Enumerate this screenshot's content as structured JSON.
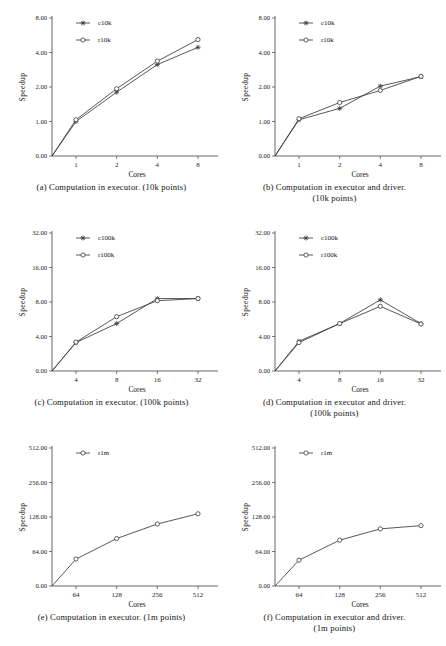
{
  "figure": {
    "ylabel": "Speedup",
    "xlabel": "Cores"
  },
  "chart_data": [
    {
      "id": "a",
      "type": "line",
      "title": "",
      "caption_lines": [
        "(a) Computation in executor. (10k points)"
      ],
      "xlabel": "Cores",
      "ylabel": "Speedup",
      "x": [
        1,
        2,
        4,
        8
      ],
      "xtick_labels": [
        "1",
        "2",
        "4",
        "8"
      ],
      "ytick_labels": [
        "0.00",
        "1.00",
        "2.00",
        "4.00",
        "8.00"
      ],
      "ytick_values": [
        0.0,
        1.0,
        2.0,
        4.0,
        8.0
      ],
      "yscale": "log2-with-zero",
      "ylim": [
        0.0,
        8.0
      ],
      "grid": false,
      "legend_position": "top-center",
      "series": [
        {
          "name": "c10k",
          "marker": "star",
          "values": [
            1.0,
            1.85,
            3.3,
            4.6
          ]
        },
        {
          "name": "r10k",
          "marker": "circle",
          "values": [
            1.05,
            1.95,
            3.5,
            5.5
          ]
        }
      ]
    },
    {
      "id": "b",
      "type": "line",
      "title": "",
      "caption_lines": [
        "(b) Computation in executor and driver.",
        "(10k points)"
      ],
      "xlabel": "Cores",
      "ylabel": "Speedup",
      "x": [
        1,
        2,
        4,
        8
      ],
      "xtick_labels": [
        "1",
        "2",
        "4",
        "8"
      ],
      "ytick_labels": [
        "0.00",
        "1.00",
        "2.00",
        "4.00",
        "8.00"
      ],
      "ytick_values": [
        0.0,
        1.0,
        2.0,
        4.0,
        8.0
      ],
      "yscale": "log2-with-zero",
      "ylim": [
        0.0,
        8.0
      ],
      "grid": false,
      "legend_position": "top-center",
      "series": [
        {
          "name": "c10k",
          "marker": "star",
          "values": [
            1.05,
            1.38,
            2.05,
            2.6
          ]
        },
        {
          "name": "r10k",
          "marker": "circle",
          "values": [
            1.08,
            1.55,
            1.9,
            2.62
          ]
        }
      ]
    },
    {
      "id": "c",
      "type": "line",
      "title": "",
      "caption_lines": [
        "(c) Computation in executor. (100k points)"
      ],
      "xlabel": "Cores",
      "ylabel": "Speedup",
      "x": [
        4,
        8,
        16,
        32
      ],
      "xtick_labels": [
        "4",
        "8",
        "16",
        "32"
      ],
      "ytick_labels": [
        "0.00",
        "4.00",
        "8.00",
        "16.00",
        "32.00"
      ],
      "ytick_values": [
        0.0,
        4.0,
        8.0,
        16.0,
        32.0
      ],
      "yscale": "log2-with-zero",
      "ylim": [
        0.0,
        32.0
      ],
      "grid": false,
      "legend_position": "top-center",
      "series": [
        {
          "name": "c100k",
          "marker": "star",
          "values": [
            3.3,
            5.5,
            8.8,
            8.8
          ]
        },
        {
          "name": "r100k",
          "marker": "circle",
          "values": [
            3.35,
            6.3,
            8.3,
            8.8
          ]
        }
      ]
    },
    {
      "id": "d",
      "type": "line",
      "title": "",
      "caption_lines": [
        "(d) Computation in executor and driver.",
        "(100k points)"
      ],
      "xlabel": "Cores",
      "ylabel": "Speedup",
      "x": [
        4,
        8,
        16,
        32
      ],
      "xtick_labels": [
        "4",
        "8",
        "16",
        "32"
      ],
      "ytick_labels": [
        "0.00",
        "4.00",
        "8.00",
        "16.00",
        "32.00"
      ],
      "ytick_values": [
        0.0,
        4.0,
        8.0,
        16.0,
        32.0
      ],
      "yscale": "log2-with-zero",
      "ylim": [
        0.0,
        32.0
      ],
      "grid": false,
      "legend_position": "top-center",
      "series": [
        {
          "name": "c100k",
          "marker": "star",
          "values": [
            3.45,
            5.5,
            8.5,
            5.5
          ]
        },
        {
          "name": "r100k",
          "marker": "circle",
          "values": [
            3.3,
            5.5,
            7.5,
            5.45
          ]
        }
      ]
    },
    {
      "id": "e",
      "type": "line",
      "title": "",
      "caption_lines": [
        "(e) Computation in executor. (1m points)"
      ],
      "xlabel": "Cores",
      "ylabel": "Speedup",
      "x": [
        64,
        128,
        256,
        512
      ],
      "xtick_labels": [
        "64",
        "128",
        "256",
        "512"
      ],
      "ytick_labels": [
        "0.00",
        "64.00",
        "128.00",
        "256.00",
        "512.00"
      ],
      "ytick_values": [
        0.0,
        64.0,
        128.0,
        256.0,
        512.0
      ],
      "yscale": "log2-with-zero",
      "ylim": [
        0.0,
        512.0
      ],
      "grid": false,
      "legend_position": "top-center",
      "series": [
        {
          "name": "r1m",
          "marker": "circle",
          "values": [
            50,
            88,
            115,
            140
          ]
        }
      ]
    },
    {
      "id": "f",
      "type": "line",
      "title": "",
      "caption_lines": [
        "(f) Computation in executor and driver.",
        "(1m points)"
      ],
      "xlabel": "Cores",
      "ylabel": "Speedup",
      "x": [
        64,
        128,
        256,
        512
      ],
      "xtick_labels": [
        "64",
        "128",
        "256",
        "512"
      ],
      "ytick_labels": [
        "0.00",
        "64.00",
        "128.00",
        "256.00",
        "512.00"
      ],
      "ytick_values": [
        0.0,
        64.0,
        128.0,
        256.0,
        512.0
      ],
      "yscale": "log2-with-zero",
      "ylim": [
        0.0,
        512.0
      ],
      "grid": false,
      "legend_position": "top-center",
      "series": [
        {
          "name": "r1m",
          "marker": "circle",
          "values": [
            48,
            85,
            106,
            112
          ]
        }
      ]
    }
  ]
}
